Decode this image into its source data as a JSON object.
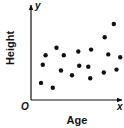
{
  "chart_data": {
    "type": "scatter",
    "title": "",
    "xlabel": "Age",
    "ylabel": "Height",
    "origin_label": "O",
    "x_axis_symbol": "x",
    "y_axis_symbol": "y",
    "xlim": [
      0,
      10
    ],
    "ylim": [
      0,
      10
    ],
    "grid": false,
    "legend": null,
    "tick_labels": {
      "x": [],
      "y": []
    },
    "point_color": "#111111",
    "axis_color": "#111111",
    "points": [
      {
        "x": 1.1,
        "y": 1.8
      },
      {
        "x": 2.4,
        "y": 1.3
      },
      {
        "x": 1.3,
        "y": 3.7
      },
      {
        "x": 1.6,
        "y": 4.7
      },
      {
        "x": 2.8,
        "y": 5.5
      },
      {
        "x": 3.6,
        "y": 4.7
      },
      {
        "x": 3.3,
        "y": 3.1
      },
      {
        "x": 4.5,
        "y": 2.6
      },
      {
        "x": 5.2,
        "y": 5.1
      },
      {
        "x": 5.3,
        "y": 3.6
      },
      {
        "x": 6.3,
        "y": 3.5
      },
      {
        "x": 6.6,
        "y": 5.3
      },
      {
        "x": 6.5,
        "y": 2.3
      },
      {
        "x": 8.0,
        "y": 2.9
      },
      {
        "x": 8.1,
        "y": 6.6
      },
      {
        "x": 8.5,
        "y": 4.8
      },
      {
        "x": 9.1,
        "y": 8.0
      },
      {
        "x": 9.4,
        "y": 3.2
      },
      {
        "x": 9.8,
        "y": 4.5
      }
    ]
  }
}
